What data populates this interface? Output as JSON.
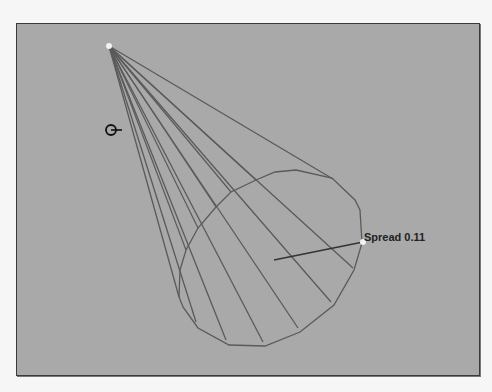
{
  "viewport": {
    "background": "#a9a9a9",
    "wire_color": "#5a5a5a"
  },
  "cone": {
    "apex": [
      109,
      46
    ],
    "base_polygon": [
      [
        179,
        297
      ],
      [
        183,
        307
      ],
      [
        198,
        328
      ],
      [
        229,
        345
      ],
      [
        265,
        346
      ],
      [
        300,
        332
      ],
      [
        334,
        305
      ],
      [
        354,
        270
      ],
      [
        362,
        243
      ],
      [
        360,
        210
      ],
      [
        355,
        200
      ],
      [
        332,
        178
      ],
      [
        296,
        170
      ],
      [
        275,
        172
      ],
      [
        256,
        180
      ],
      [
        231,
        192
      ],
      [
        216,
        207
      ],
      [
        198,
        228
      ],
      [
        186,
        250
      ],
      [
        180,
        270
      ]
    ],
    "silhouette_targets": [
      [
        333,
        179
      ],
      [
        179,
        297
      ]
    ]
  },
  "spread_handle": {
    "label": "Spread 0.11",
    "handle_point": [
      363,
      242
    ],
    "center_point": [
      274,
      260
    ]
  },
  "cursor": {
    "icon": "rotate-cursor-icon",
    "position": [
      106,
      130
    ]
  }
}
